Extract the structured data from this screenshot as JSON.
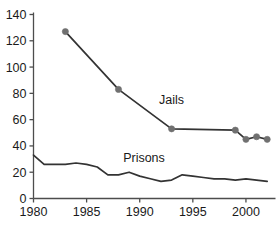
{
  "chart_data": {
    "type": "line",
    "title": "Rate per 100,000 residents",
    "title_clipped": true,
    "xlabel": "",
    "ylabel": "",
    "xlim": [
      1980,
      2002.5
    ],
    "ylim": [
      0,
      140
    ],
    "xticks": [
      1980,
      1985,
      1990,
      1995,
      2000
    ],
    "xticklabels": [
      "1980",
      "1985",
      "1990",
      "1995",
      "2000"
    ],
    "yticks": [
      0,
      20,
      40,
      60,
      80,
      100,
      120,
      140
    ],
    "yticklabels": [
      "0",
      "20",
      "40",
      "60",
      "80",
      "100",
      "120",
      "140"
    ],
    "grid": false,
    "legend": "inline-annotations",
    "series": [
      {
        "name": "Jails",
        "markers": true,
        "marker_color": "#707070",
        "line_color": "#333333",
        "x": [
          1983,
          1988,
          1993,
          1999,
          2000,
          2001,
          2002
        ],
        "values": [
          127,
          83,
          53,
          52,
          45,
          47,
          45
        ]
      },
      {
        "name": "Prisons",
        "markers": false,
        "marker_color": "#707070",
        "line_color": "#333333",
        "x": [
          1980,
          1981,
          1982,
          1983,
          1984,
          1985,
          1986,
          1987,
          1988,
          1989,
          1990,
          1991,
          1992,
          1993,
          1994,
          1995,
          1996,
          1997,
          1998,
          1999,
          2000,
          2001,
          2002
        ],
        "values": [
          33,
          26,
          26,
          26,
          27,
          26,
          24,
          18,
          18,
          20,
          17,
          15,
          13,
          14,
          18,
          17,
          16,
          15,
          15,
          14,
          15,
          14,
          13
        ]
      }
    ],
    "annotations": [
      {
        "text": "Jails",
        "x": 1993.0,
        "y": 72
      },
      {
        "text": "Prisons",
        "x": 1990.4,
        "y": 28
      }
    ],
    "colors": {
      "axis": "#4d4d4d",
      "line": "#333333",
      "marker": "#707070",
      "text": "#1a1a1a",
      "background": "#ffffff"
    }
  }
}
